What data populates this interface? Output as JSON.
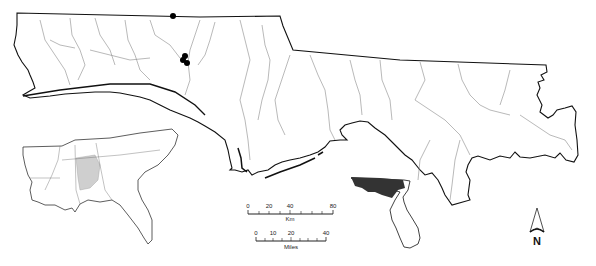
{
  "figure": {
    "type": "map"
  },
  "main_map": {
    "region": "Florida panhandle",
    "boundary_color": "#111111",
    "river_color": "#8a8a8a",
    "sites": [
      {
        "x": 173,
        "y": 16
      },
      {
        "x": 185,
        "y": 56
      },
      {
        "x": 183,
        "y": 60
      },
      {
        "x": 187,
        "y": 63
      }
    ],
    "site_color": "#000000"
  },
  "inset_southeast": {
    "region": "Southeastern United States",
    "highlight_color": "#cfcfcf"
  },
  "inset_florida": {
    "region": "Florida",
    "highlight_color": "#333333"
  },
  "scale_km": {
    "ticks": [
      "0",
      "20",
      "40",
      "80"
    ],
    "unit": "Km"
  },
  "scale_miles": {
    "ticks": [
      "0",
      "10",
      "20",
      "40"
    ],
    "unit": "Miles"
  },
  "north_arrow": {
    "label": "N"
  }
}
